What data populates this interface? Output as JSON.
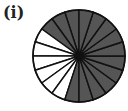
{
  "label": "(i)",
  "figure": {
    "type": "fraction-circle",
    "total_parts": 20,
    "shaded_parts": 14,
    "unshaded_parts": 6,
    "shaded_color": "#555555",
    "unshaded_color": "#ffffff",
    "line_color": "#111111",
    "unshaded_slice_indices": [
      3,
      4,
      5,
      6,
      7,
      8
    ]
  }
}
